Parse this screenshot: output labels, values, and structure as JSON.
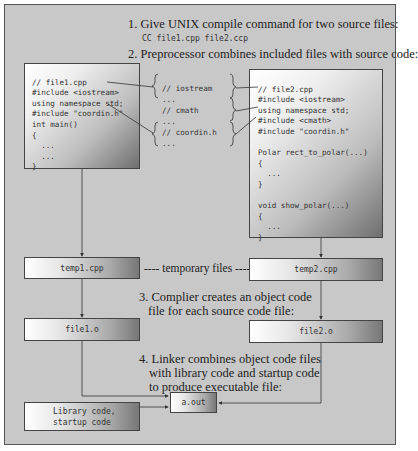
{
  "steps": {
    "step1": "1. Give UNIX compile command for two source files:",
    "command": "CC file1.cpp file2.ccp",
    "step2": "2. Preprocessor combines included files with source code:",
    "step3_line1": "3. Complier creates an object code",
    "step3_line2": "file for each source code file:",
    "step4_line1": "4. Linker combines object code files",
    "step4_line2": "with library code and startup code",
    "step4_line3": "to produce executable file:"
  },
  "file1": {
    "lines": [
      "// file1.cpp",
      "#include <iostream>",
      "using namespace std;",
      "#include \"coordin.h\"",
      "int main()",
      "{",
      "  ...",
      "  ...",
      "}"
    ]
  },
  "includes": {
    "lines": [
      "// iostream",
      "...",
      "// cmath",
      "...",
      "// coordin.h",
      "..."
    ]
  },
  "file2": {
    "lines": [
      "// file2.cpp",
      "#include <iostream>",
      "using namespace std;",
      "#include <cmath>",
      "#include \"coordin.h\"",
      "",
      "Polar rect_to_polar(...)",
      "{",
      "  ...",
      "}",
      "",
      "void show_polar(...)",
      "{",
      "  ...",
      "}"
    ]
  },
  "files": {
    "temp1": "temp1.cpp",
    "temp2": "temp2.cpp",
    "temporary_label": "---- temporary files ----",
    "obj1": "file1.o",
    "obj2": "file2.o",
    "exe": "a.out",
    "library_line1": "Library code,",
    "library_line2": "startup code"
  },
  "colors": {
    "background": "#c8c8c8",
    "border": "#444444",
    "line": "#333333"
  }
}
